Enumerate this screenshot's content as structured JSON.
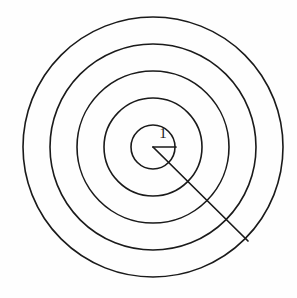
{
  "figure": {
    "background_color": "#fefefe",
    "stroke_color": "#1a1a1a",
    "width": 297,
    "height": 298
  },
  "labels": {
    "unit_radius": "1"
  },
  "chart_data": {
    "type": "scatter",
    "xlabel": "",
    "ylabel": "",
    "grid": false,
    "legend": null,
    "center": {
      "x": 153,
      "y": 147
    },
    "xlim": [
      0,
      297
    ],
    "ylim": [
      0,
      298
    ],
    "circles": [
      {
        "index": 1,
        "radius": 22,
        "label": "1"
      },
      {
        "index": 2,
        "radius": 49,
        "label": "2"
      },
      {
        "index": 3,
        "radius": 76,
        "label": "3"
      },
      {
        "index": 4,
        "radius": 103,
        "label": "4"
      },
      {
        "index": 5,
        "radius": 130,
        "label": "5"
      }
    ],
    "radius_segments": [
      {
        "name": "horizontal-radius",
        "from": {
          "x": 153,
          "y": 147
        },
        "to": {
          "x": 176,
          "y": 147
        },
        "annotation": "1"
      },
      {
        "name": "diagonal-ray",
        "from": {
          "x": 153,
          "y": 147
        },
        "to": {
          "x": 248,
          "y": 241
        },
        "annotation": ""
      }
    ],
    "annotations": [
      {
        "text": "1",
        "x": 163,
        "y": 138
      }
    ]
  }
}
